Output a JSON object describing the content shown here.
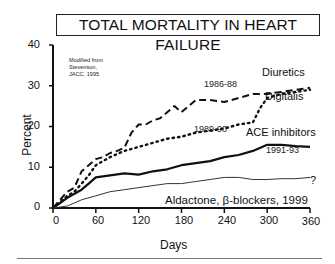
{
  "chart_data": {
    "type": "line",
    "title": "TOTAL MORTALITY IN HEART FAILURE",
    "xlabel": "Days",
    "ylabel": "Percent",
    "xlim": [
      0,
      360
    ],
    "ylim": [
      0,
      40
    ],
    "xticks": [
      0,
      60,
      120,
      180,
      240,
      300,
      360
    ],
    "yticks": [
      0,
      10,
      20,
      30,
      40
    ],
    "grid": false,
    "legend_position": "inline labels at right end of lines",
    "annotation": "Modified from Stevenson, JACC, 1995",
    "series": [
      {
        "name": "Diuretics",
        "period": "1986-88",
        "style": "dashed",
        "x": [
          0,
          10,
          20,
          30,
          40,
          50,
          60,
          70,
          80,
          90,
          100,
          110,
          120,
          130,
          140,
          150,
          160,
          170,
          180,
          200,
          220,
          240,
          260,
          280,
          300,
          320,
          340,
          360
        ],
        "y": [
          0,
          2,
          4,
          5,
          9,
          10.5,
          12,
          12.5,
          13.5,
          14,
          14.8,
          18.5,
          20.5,
          20.5,
          21.5,
          22,
          23.5,
          25,
          23.5,
          26.5,
          26.5,
          26,
          27,
          28,
          28,
          28.5,
          29,
          29.5
        ]
      },
      {
        "name": "Digitalis",
        "period": "1989-90",
        "style": "dotted",
        "x": [
          0,
          20,
          30,
          40,
          50,
          60,
          70,
          80,
          100,
          120,
          140,
          160,
          180,
          200,
          220,
          240,
          260,
          280,
          290,
          300,
          320,
          340,
          360
        ],
        "y": [
          0,
          3,
          4,
          6,
          8,
          10.5,
          11.5,
          12.5,
          14,
          15,
          16,
          17,
          17.5,
          18.5,
          19,
          19.5,
          20.5,
          21,
          24.5,
          27,
          28,
          28.5,
          29
        ]
      },
      {
        "name": "ACE inhibitors",
        "period": "1991-93",
        "style": "solid-thick",
        "x": [
          0,
          20,
          40,
          50,
          60,
          80,
          100,
          120,
          140,
          160,
          180,
          200,
          220,
          240,
          260,
          280,
          300,
          320,
          340,
          360
        ],
        "y": [
          0,
          2.5,
          4.5,
          6,
          7.5,
          8,
          8.5,
          8.2,
          9,
          9.5,
          10.5,
          11,
          11.5,
          12.5,
          13,
          14,
          15.5,
          15.5,
          15.2,
          15
        ]
      },
      {
        "name": "Aldactone, β-blockers, 1999",
        "period": "1999",
        "style": "solid-thin",
        "x": [
          0,
          20,
          40,
          60,
          80,
          100,
          120,
          140,
          160,
          180,
          200,
          220,
          240,
          260,
          280,
          300,
          320,
          340,
          360
        ],
        "y": [
          0,
          0.5,
          2,
          3,
          4,
          4.5,
          5,
          5.5,
          6,
          6,
          6.5,
          7,
          7.5,
          7.5,
          7,
          7,
          7.2,
          7.2,
          7.5
        ],
        "end_marker": "?"
      }
    ]
  },
  "labels": {
    "title": "TOTAL MORTALITY IN HEART FAILURE",
    "note_line1": "Modified from",
    "note_line2": "Stevenson,",
    "note_line3": "JACC, 1995",
    "diuretics": "Diuretics",
    "digitalis": "Digitalis",
    "ace": "ACE inhibitors",
    "aldactone": "Aldactone, β-blockers, 1999",
    "p1": "1986-88",
    "p2": "1989-90",
    "p3": "1991-93",
    "question": "?",
    "xlabel": "Days",
    "ylabel": "Percent",
    "xticks": [
      "0",
      "60",
      "120",
      "180",
      "240",
      "300",
      "360"
    ],
    "yticks": [
      "0",
      "10",
      "20",
      "30",
      "40"
    ]
  }
}
